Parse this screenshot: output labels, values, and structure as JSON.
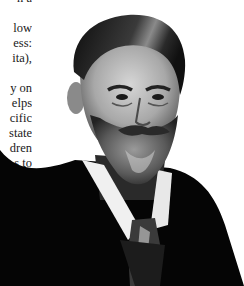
{
  "document": {
    "text_fragments": [
      {
        "text": "n a",
        "top": -8
      },
      {
        "text": "low",
        "top": 22
      },
      {
        "text": "ess:",
        "top": 37
      },
      {
        "text": "ita),",
        "top": 52
      },
      {
        "text": "y  on",
        "top": 82
      },
      {
        "text": "elps",
        "top": 97
      },
      {
        "text": "cific",
        "top": 112
      },
      {
        "text": "state",
        "top": 127
      },
      {
        "text": "dren",
        "top": 142
      },
      {
        "text": "s  to",
        "top": 157
      }
    ]
  },
  "image": {
    "description": "Black-and-white portrait photograph of a bearded man with slicked-back hair wearing a dark suit, white collar and patterned tie",
    "colors": {
      "background": "#ffffff",
      "suit": "#050505",
      "skin": "#bdbdbd",
      "hair": "#1c1c1c",
      "beard": "#6e6e6e",
      "collar": "#f0f0f0"
    }
  }
}
